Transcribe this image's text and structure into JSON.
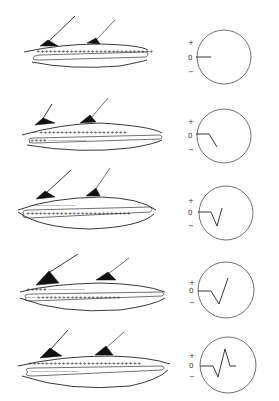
{
  "figure": {
    "colors": {
      "ink": "#222222",
      "background": "#ffffff"
    },
    "scope_labels": {
      "plus": "+",
      "zero": "0",
      "minus": "−"
    },
    "stages": [
      {
        "id": 1,
        "membrane_outer": "++++++++++++++++++++++++++++",
        "membrane_inner": "",
        "trace": "flat",
        "offset_y": 0
      },
      {
        "id": 2,
        "membrane_outer": "--- +++++++++++++++++++++",
        "membrane_inner": "++++ ---------------------",
        "trace": "downward deflection begins",
        "offset_y": 79
      },
      {
        "id": 3,
        "membrane_outer": "-------------------------",
        "membrane_inner": "+++++++++++++++++++++++++",
        "trace": "negative peak",
        "offset_y": 156
      },
      {
        "id": 4,
        "membrane_outer": "+++++ --------------------",
        "membrane_inner": "----- ++++++++++++++++++++",
        "trace": "return through zero rising positive",
        "offset_y": 233
      },
      {
        "id": 5,
        "membrane_outer": "+++++++++++++++++++++++++++",
        "membrane_inner": "---------------------------",
        "trace": "biphasic complete",
        "offset_y": 308
      }
    ]
  }
}
